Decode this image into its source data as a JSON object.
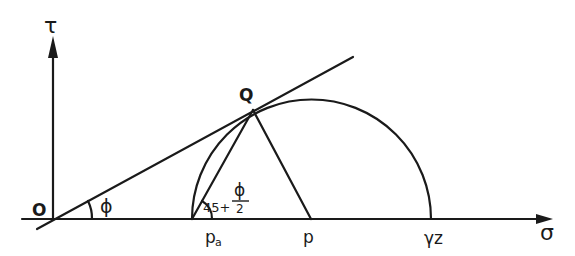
{
  "diagram": {
    "type": "Mohr circle - passive/active earth pressure construction",
    "axes": {
      "x_label": "σ",
      "y_label": "τ"
    },
    "points": {
      "origin": "O",
      "tangent_point": "Q",
      "pole": "pa",
      "pole_main": "p",
      "pole_sub": "a",
      "center": "p",
      "max_stress": "γz"
    },
    "angles": {
      "friction_angle": "ϕ",
      "failure_plane_prefix": "45+",
      "failure_plane_num": "ϕ",
      "failure_plane_den": "2"
    },
    "colors": {
      "ink": "#1a1a1a",
      "background": "#ffffff"
    }
  }
}
